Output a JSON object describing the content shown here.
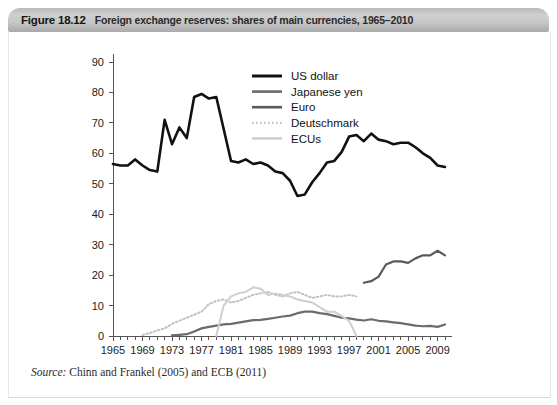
{
  "header": {
    "figure_number": "Figure 18.12",
    "caption": "Foreign exchange reserves: shares of main currencies, 1965–2010"
  },
  "footer": {
    "source_label": "Source:",
    "source_text": "Chinn and Frankel (2005) and ECB (2011)"
  },
  "colors": {
    "us_dollar": "#111111",
    "japanese_yen": "#6b6b6b",
    "euro": "#5a5a5a",
    "deutschmark": "#c2c2c2",
    "ecus": "#cfcfcf",
    "axis": "#555555",
    "header_gray": "#c3c3c3",
    "panel_bg": "#ffffff"
  },
  "chart_data": {
    "type": "line",
    "title": "Foreign exchange reserves: shares of main currencies, 1965–2010",
    "xlabel": "",
    "ylabel": "",
    "xlim": [
      1965,
      2010
    ],
    "ylim": [
      0,
      90
    ],
    "ytick_step": 10,
    "xtick_step": 4,
    "grid": false,
    "legend_position": "top-center",
    "yticks": [
      0,
      10,
      20,
      30,
      40,
      50,
      60,
      70,
      80,
      90
    ],
    "xticks": [
      1965,
      1969,
      1973,
      1977,
      1981,
      1985,
      1989,
      1993,
      1997,
      2001,
      2005,
      2009
    ],
    "x_minor_ticks_every": 1,
    "series": [
      {
        "name": "US dollar",
        "style": "solid",
        "width": 2.6,
        "color": "#111111",
        "x": [
          1965,
          1966,
          1967,
          1968,
          1969,
          1970,
          1971,
          1972,
          1973,
          1974,
          1975,
          1976,
          1977,
          1978,
          1979,
          1980,
          1981,
          1982,
          1983,
          1984,
          1985,
          1986,
          1987,
          1988,
          1989,
          1990,
          1991,
          1992,
          1993,
          1994,
          1995,
          1996,
          1997,
          1998,
          1999,
          2000,
          2001,
          2002,
          2003,
          2004,
          2005,
          2006,
          2007,
          2008,
          2009,
          2010
        ],
        "y": [
          56.5,
          56.0,
          56.0,
          58.0,
          56.0,
          54.5,
          54.0,
          71.0,
          63.0,
          68.5,
          65.0,
          78.5,
          79.5,
          78.0,
          78.5,
          68.0,
          57.5,
          57.0,
          58.0,
          56.5,
          57.0,
          56.0,
          54.0,
          53.5,
          51.0,
          46.0,
          46.5,
          50.5,
          53.5,
          57.0,
          57.5,
          60.5,
          65.5,
          66.0,
          64.0,
          66.5,
          64.5,
          64.0,
          63.0,
          63.5,
          63.5,
          62.0,
          60.0,
          58.5,
          56.0,
          55.5
        ]
      },
      {
        "name": "Japanese yen",
        "style": "solid",
        "width": 2.2,
        "color": "#6b6b6b",
        "x": [
          1973,
          1974,
          1975,
          1976,
          1977,
          1978,
          1979,
          1980,
          1981,
          1982,
          1983,
          1984,
          1985,
          1986,
          1987,
          1988,
          1989,
          1990,
          1991,
          1992,
          1993,
          1994,
          1995,
          1996,
          1997,
          1998,
          1999,
          2000,
          2001,
          2002,
          2003,
          2004,
          2005,
          2006,
          2007,
          2008,
          2009,
          2010
        ],
        "y": [
          0.2,
          0.4,
          0.6,
          1.5,
          2.5,
          3.0,
          3.4,
          3.8,
          4.0,
          4.4,
          4.8,
          5.2,
          5.3,
          5.6,
          6.0,
          6.4,
          6.7,
          7.5,
          8.0,
          8.0,
          7.5,
          7.2,
          6.6,
          6.0,
          5.8,
          5.4,
          5.1,
          5.5,
          5.0,
          4.8,
          4.5,
          4.2,
          3.8,
          3.4,
          3.2,
          3.3,
          3.0,
          3.8
        ]
      },
      {
        "name": "Euro",
        "style": "solid",
        "width": 2.2,
        "color": "#5a5a5a",
        "x": [
          1999,
          2000,
          2001,
          2002,
          2003,
          2004,
          2005,
          2006,
          2007,
          2008,
          2009,
          2010
        ],
        "y": [
          17.5,
          18.0,
          19.5,
          23.5,
          24.5,
          24.5,
          24.0,
          25.5,
          26.5,
          26.5,
          28.0,
          26.5
        ]
      },
      {
        "name": "Deutschmark",
        "style": "dotted",
        "width": 2.0,
        "color": "#c2c2c2",
        "x": [
          1969,
          1970,
          1971,
          1972,
          1973,
          1974,
          1975,
          1976,
          1977,
          1978,
          1979,
          1980,
          1981,
          1982,
          1983,
          1984,
          1985,
          1986,
          1987,
          1988,
          1989,
          1990,
          1991,
          1992,
          1993,
          1994,
          1995,
          1996,
          1997,
          1998
        ],
        "y": [
          0.3,
          1.0,
          1.8,
          2.5,
          4.0,
          5.0,
          6.0,
          7.0,
          8.0,
          10.5,
          11.5,
          12.0,
          11.0,
          11.5,
          12.5,
          13.5,
          14.0,
          14.5,
          13.5,
          13.0,
          14.0,
          14.5,
          13.5,
          12.5,
          13.0,
          13.5,
          13.0,
          13.0,
          13.5,
          13.0
        ]
      },
      {
        "name": "ECUs",
        "style": "solid",
        "width": 2.0,
        "color": "#cfcfcf",
        "x": [
          1979,
          1980,
          1981,
          1982,
          1983,
          1984,
          1985,
          1986,
          1987,
          1988,
          1989,
          1990,
          1991,
          1992,
          1993,
          1994,
          1995,
          1996,
          1997,
          1998
        ],
        "y": [
          0.0,
          10.0,
          13.0,
          14.0,
          14.5,
          16.0,
          15.5,
          13.5,
          14.0,
          13.5,
          13.0,
          12.0,
          11.5,
          11.0,
          9.5,
          8.0,
          8.0,
          6.5,
          5.0,
          0.0
        ]
      }
    ]
  },
  "legend": {
    "items": [
      {
        "label": "US dollar",
        "color": "#111111",
        "style": "solid",
        "width": 3.0
      },
      {
        "label": "Japanese yen",
        "color": "#6b6b6b",
        "style": "solid",
        "width": 2.6
      },
      {
        "label": "Euro",
        "color": "#5a5a5a",
        "style": "solid",
        "width": 2.6
      },
      {
        "label": "Deutschmark",
        "color": "#c2c2c2",
        "style": "dotted",
        "width": 2.2
      },
      {
        "label": "ECUs",
        "color": "#cfcfcf",
        "style": "solid",
        "width": 2.6
      }
    ]
  }
}
